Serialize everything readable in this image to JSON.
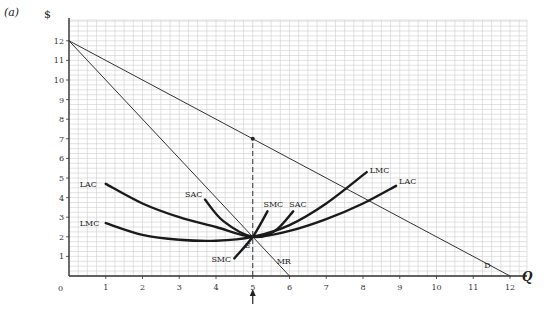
{
  "panel_label": "(a)",
  "chart_data": {
    "type": "line",
    "title": "",
    "xlabel": "Q",
    "ylabel": "$",
    "xlim": [
      0,
      12
    ],
    "ylim": [
      0,
      12
    ],
    "x_ticks": [
      0,
      1,
      2,
      3,
      4,
      5,
      6,
      7,
      8,
      9,
      10,
      11,
      12
    ],
    "y_ticks": [
      1,
      2,
      3,
      4,
      5,
      6,
      7,
      8,
      9,
      10,
      11,
      12
    ],
    "grid": true,
    "grid_minor_per_unit": 4,
    "series": [
      {
        "name": "D",
        "points": [
          [
            0,
            12
          ],
          [
            12,
            0
          ]
        ]
      },
      {
        "name": "MR",
        "points": [
          [
            0,
            12
          ],
          [
            6,
            0
          ]
        ]
      },
      {
        "name": "LAC",
        "points": [
          [
            1,
            4.7
          ],
          [
            2,
            3.7
          ],
          [
            3,
            3.0
          ],
          [
            4,
            2.5
          ],
          [
            5,
            2.0
          ],
          [
            6,
            2.3
          ],
          [
            7,
            2.9
          ],
          [
            8,
            3.7
          ],
          [
            8.9,
            4.6
          ]
        ]
      },
      {
        "name": "LMC",
        "points": [
          [
            1,
            2.7
          ],
          [
            2,
            2.1
          ],
          [
            3,
            1.85
          ],
          [
            4,
            1.8
          ],
          [
            5,
            2.0
          ],
          [
            6,
            2.6
          ],
          [
            7,
            3.7
          ],
          [
            8.1,
            5.3
          ]
        ]
      },
      {
        "name": "SAC",
        "points": [
          [
            3.7,
            3.9
          ],
          [
            4.2,
            2.8
          ],
          [
            5,
            2.0
          ],
          [
            5.6,
            2.3
          ],
          [
            6.1,
            3.3
          ]
        ]
      },
      {
        "name": "SMC",
        "points": [
          [
            4.5,
            0.9
          ],
          [
            5,
            2.0
          ],
          [
            5.4,
            3.3
          ]
        ]
      }
    ],
    "annotations": [
      {
        "text": "E",
        "x": 5,
        "y": 2,
        "note": "equilibrium where MR = LMC = SMC"
      },
      {
        "text": "dashed vertical line at Q = 5 up to demand (price 7)",
        "x": 5,
        "y": 7
      },
      {
        "text": "arrow below x-axis at Q = 5",
        "x": 5,
        "y": 0
      }
    ],
    "curve_labels": {
      "LAC_left": "LAC",
      "LMC_left": "LMC",
      "SAC_left": "SAC",
      "SAC_right": "SAC",
      "SMC_top": "SMC",
      "SMC_bottom": "SMC",
      "LMC_right": "LMC",
      "LAC_right": "LAC",
      "MR": "MR",
      "D": "D",
      "E": "E"
    },
    "legend": "none"
  },
  "axis": {
    "y_title": "$",
    "x_title": "Q",
    "origin_label": "0",
    "x_labels": [
      "1",
      "2",
      "3",
      "4",
      "5",
      "6",
      "7",
      "8",
      "9",
      "10",
      "11",
      "12"
    ],
    "y_labels": [
      "1",
      "2",
      "3",
      "4",
      "5",
      "6",
      "7",
      "8",
      "9",
      "10",
      "11",
      "12"
    ]
  }
}
